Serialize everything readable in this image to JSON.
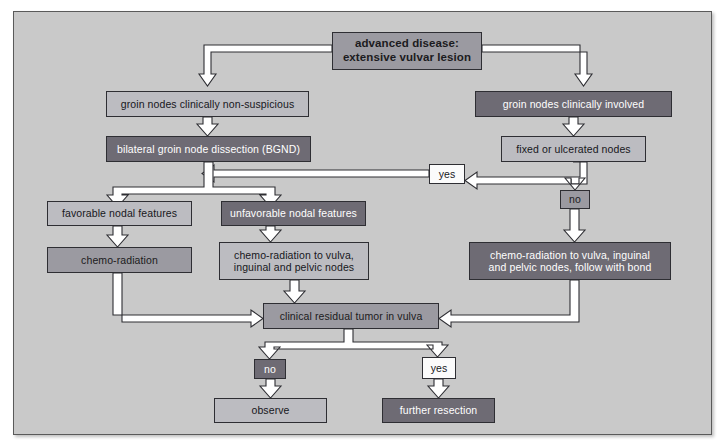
{
  "diagram": {
    "colors": {
      "panel_background": "#c9c9c9",
      "panel_border": "#5a5a5a",
      "fill_dark": "#6e6b74",
      "fill_mid": "#9b9aa1",
      "fill_light": "#bcbcc1",
      "fill_white": "#fbfbfb",
      "arrow_fill": "#ffffff",
      "arrow_stroke": "#2e2e33"
    },
    "nodes": [
      {
        "id": "advanced_disease",
        "label": "advanced disease:\nextensive vulvar lesion",
        "style": "fill-mid",
        "x": 318,
        "y": 20,
        "w": 150,
        "h": 38,
        "font": 11.5,
        "bold": true
      },
      {
        "id": "nodes_nonsuspicious",
        "label": "groin nodes clinically non-suspicious",
        "style": "fill-light",
        "x": 92,
        "y": 79,
        "w": 203,
        "h": 26,
        "font": 10.5,
        "bold": false
      },
      {
        "id": "nodes_involved",
        "label": "groin nodes clinically involved",
        "style": "fill-dark",
        "x": 461,
        "y": 79,
        "w": 197,
        "h": 26,
        "font": 10.5,
        "bold": false
      },
      {
        "id": "bgnd",
        "label": "bilateral groin node dissection (BGND)",
        "style": "fill-dark",
        "x": 92,
        "y": 124,
        "w": 205,
        "h": 26,
        "font": 10.5,
        "bold": false
      },
      {
        "id": "fixed_ulcerated",
        "label": "fixed or ulcerated nodes",
        "style": "fill-light",
        "x": 487,
        "y": 124,
        "w": 145,
        "h": 26,
        "font": 10.5,
        "bold": false
      },
      {
        "id": "yes_upper",
        "label": "yes",
        "style": "fill-white",
        "x": 415,
        "y": 152,
        "w": 36,
        "h": 20,
        "font": 10.5,
        "bold": false
      },
      {
        "id": "no_right",
        "label": "no",
        "style": "fill-mid",
        "x": 546,
        "y": 178,
        "w": 30,
        "h": 19,
        "font": 10.5,
        "bold": false
      },
      {
        "id": "favorable",
        "label": "favorable nodal features",
        "style": "fill-light",
        "x": 33,
        "y": 189,
        "w": 145,
        "h": 25,
        "font": 10.5,
        "bold": false
      },
      {
        "id": "unfavorable",
        "label": "unfavorable nodal features",
        "style": "fill-dark",
        "x": 207,
        "y": 189,
        "w": 145,
        "h": 25,
        "font": 10.5,
        "bold": false
      },
      {
        "id": "chemo_rad",
        "label": "chemo-radiation",
        "style": "fill-mid",
        "x": 33,
        "y": 235,
        "w": 145,
        "h": 26,
        "font": 10.5,
        "bold": false
      },
      {
        "id": "chemo_rad_nodes",
        "label": "chemo-radiation to vulva,\ninguinal and pelvic nodes",
        "style": "fill-light",
        "x": 205,
        "y": 230,
        "w": 150,
        "h": 38,
        "font": 10.5,
        "bold": false
      },
      {
        "id": "chemo_rad_bond",
        "label": "chemo-radiation to vulva, inguinal\nand pelvic nodes, follow with bond",
        "style": "fill-dark",
        "x": 455,
        "y": 230,
        "w": 202,
        "h": 38,
        "font": 10.5,
        "bold": false
      },
      {
        "id": "residual_tumor",
        "label": "clinical residual tumor in vulva",
        "style": "fill-mid",
        "x": 249,
        "y": 291,
        "w": 176,
        "h": 26,
        "font": 10.5,
        "bold": false
      },
      {
        "id": "no_bottom",
        "label": "no",
        "style": "fill-dark",
        "x": 240,
        "y": 347,
        "w": 32,
        "h": 20,
        "font": 10.5,
        "bold": false
      },
      {
        "id": "yes_bottom",
        "label": "yes",
        "style": "fill-white",
        "x": 408,
        "y": 345,
        "w": 34,
        "h": 22,
        "font": 10.5,
        "bold": false
      },
      {
        "id": "observe",
        "label": "observe",
        "style": "fill-light",
        "x": 200,
        "y": 386,
        "w": 113,
        "h": 25,
        "font": 10.5,
        "bold": false
      },
      {
        "id": "further_resection",
        "label": "further resection",
        "style": "fill-dark",
        "x": 368,
        "y": 386,
        "w": 113,
        "h": 25,
        "font": 10.5,
        "bold": false
      }
    ],
    "edges": [
      {
        "from": "advanced_disease",
        "to": "nodes_nonsuspicious",
        "label": ""
      },
      {
        "from": "advanced_disease",
        "to": "nodes_involved",
        "label": ""
      },
      {
        "from": "nodes_nonsuspicious",
        "to": "bgnd",
        "label": ""
      },
      {
        "from": "nodes_involved",
        "to": "fixed_ulcerated",
        "label": ""
      },
      {
        "from": "fixed_ulcerated",
        "to": "yes_upper",
        "label": "yes"
      },
      {
        "from": "yes_upper",
        "to": "bgnd",
        "label": ""
      },
      {
        "from": "fixed_ulcerated",
        "to": "no_right",
        "label": "no"
      },
      {
        "from": "bgnd",
        "to": "favorable",
        "label": ""
      },
      {
        "from": "bgnd",
        "to": "unfavorable",
        "label": ""
      },
      {
        "from": "favorable",
        "to": "chemo_rad",
        "label": ""
      },
      {
        "from": "unfavorable",
        "to": "chemo_rad_nodes",
        "label": ""
      },
      {
        "from": "no_right",
        "to": "chemo_rad_bond",
        "label": ""
      },
      {
        "from": "chemo_rad",
        "to": "residual_tumor",
        "label": ""
      },
      {
        "from": "chemo_rad_nodes",
        "to": "residual_tumor",
        "label": ""
      },
      {
        "from": "chemo_rad_bond",
        "to": "residual_tumor",
        "label": ""
      },
      {
        "from": "residual_tumor",
        "to": "no_bottom",
        "label": "no"
      },
      {
        "from": "residual_tumor",
        "to": "yes_bottom",
        "label": "yes"
      },
      {
        "from": "no_bottom",
        "to": "observe",
        "label": ""
      },
      {
        "from": "yes_bottom",
        "to": "further_resection",
        "label": ""
      }
    ]
  }
}
